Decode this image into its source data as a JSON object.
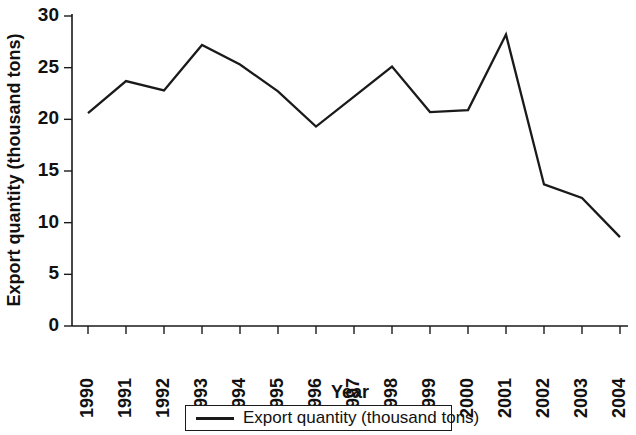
{
  "chart_data": {
    "type": "line",
    "title": "",
    "xlabel": "Year",
    "ylabel": "Export quantity (thousand tons)",
    "categories": [
      "1990",
      "1991",
      "1992",
      "1993",
      "1994",
      "1995",
      "1996",
      "1997",
      "1998",
      "1999",
      "2000",
      "2001",
      "2002",
      "2003",
      "2004"
    ],
    "series": [
      {
        "name": "Export quantity (thousand tons)",
        "values": [
          20.6,
          23.7,
          22.8,
          27.2,
          25.3,
          22.7,
          19.3,
          22.2,
          25.1,
          20.7,
          20.9,
          28.2,
          13.7,
          12.4,
          8.6
        ],
        "color": "#1a1a1a"
      }
    ],
    "yticks": [
      0,
      5,
      10,
      15,
      20,
      25,
      30
    ],
    "ylim": [
      0,
      30
    ],
    "ytick_labels": [
      "0",
      "5",
      "10",
      "15",
      "20",
      "25",
      "30"
    ],
    "grid": false,
    "legend": {
      "position": "bottom",
      "entries": [
        {
          "label": "Export quantity (thousand tons)",
          "marker": "line",
          "color": "#1a1a1a"
        }
      ]
    }
  }
}
